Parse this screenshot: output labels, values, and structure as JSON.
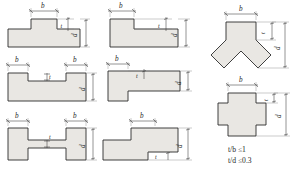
{
  "diagram": {
    "fill_color": "#e9e7e3",
    "stroke_color": "#2b2b2b",
    "labels": {
      "b": "b",
      "t": "t",
      "d": "d"
    },
    "constraints": [
      {
        "id": "ratio-t-b",
        "lhs": "t/b",
        "op": "≤",
        "rhs": "1",
        "text": "t/b ≤1"
      },
      {
        "id": "ratio-t-d",
        "lhs": "t/d",
        "op": "≤",
        "rhs": "0.3",
        "text": "t/d ≤0.3"
      }
    ],
    "shapes": [
      {
        "id": "tee-upright",
        "name": "tee-section",
        "row": 1,
        "col": 1,
        "dims": [
          "b",
          "t",
          "d"
        ]
      },
      {
        "id": "angle-l",
        "name": "angle-section",
        "row": 1,
        "col": 2,
        "dims": [
          "b",
          "t",
          "d"
        ]
      },
      {
        "id": "wye-joint",
        "name": "wye-joint-section",
        "row": 1,
        "col": 3,
        "dims": [
          "b",
          "t",
          "d"
        ]
      },
      {
        "id": "channel-u",
        "name": "channel-section",
        "row": 2,
        "col": 1,
        "dims": [
          "b",
          "b",
          "t",
          "d"
        ]
      },
      {
        "id": "tee-lateral",
        "name": "lateral-tee-section",
        "row": 2,
        "col": 2,
        "dims": [
          "b",
          "t",
          "d"
        ]
      },
      {
        "id": "cross-plus",
        "name": "cross-section-plus",
        "row": 2,
        "col": 3,
        "dims": [
          "b",
          "t",
          "d"
        ]
      },
      {
        "id": "ibeam-h",
        "name": "i-beam-section",
        "row": 3,
        "col": 1,
        "dims": [
          "b",
          "b",
          "t",
          "d"
        ]
      },
      {
        "id": "zed-step",
        "name": "stepped-zee-section",
        "row": 3,
        "col": 2,
        "dims": [
          "b",
          "t",
          "d"
        ]
      }
    ]
  }
}
